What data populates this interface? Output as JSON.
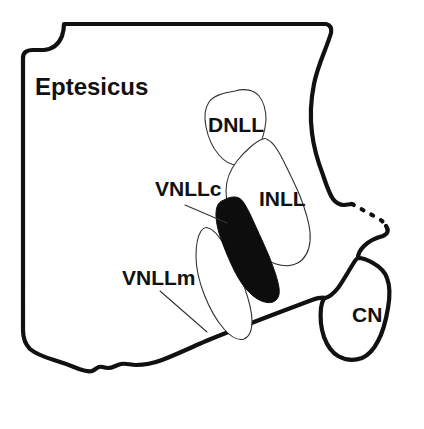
{
  "figure": {
    "species_label": "Eptesicus",
    "background_color": "#ffffff",
    "ink_color": "#111111",
    "filled_region_color": "#0d0d0d",
    "thin_outline_color": "#333333"
  },
  "regions": [
    {
      "key": "dnll",
      "label": "DNLL",
      "name": "dorsal-nucleus-lateral-lemniscus",
      "fill": "white",
      "label_x": 208,
      "label_y": 132,
      "font_size": 21
    },
    {
      "key": "inll",
      "label": "INLL",
      "name": "intermediate-nucleus-lateral-lemniscus",
      "fill": "white",
      "label_x": 259,
      "label_y": 206,
      "font_size": 21
    },
    {
      "key": "vnllc",
      "label": "VNLLc",
      "name": "ventral-nucleus-lateral-lemniscus-columnar",
      "fill": "black",
      "label_x": 155,
      "label_y": 196,
      "font_size": 21
    },
    {
      "key": "vnllm",
      "label": "VNLLm",
      "name": "ventral-nucleus-lateral-lemniscus-multipolar",
      "fill": "white",
      "label_x": 122,
      "label_y": 285,
      "font_size": 21
    },
    {
      "key": "cn",
      "label": "CN",
      "name": "cochlear-nucleus",
      "fill": "white",
      "label_x": 352,
      "label_y": 322,
      "font_size": 21
    }
  ],
  "species": {
    "label_x": 35,
    "label_y": 95,
    "font_size": 24
  }
}
